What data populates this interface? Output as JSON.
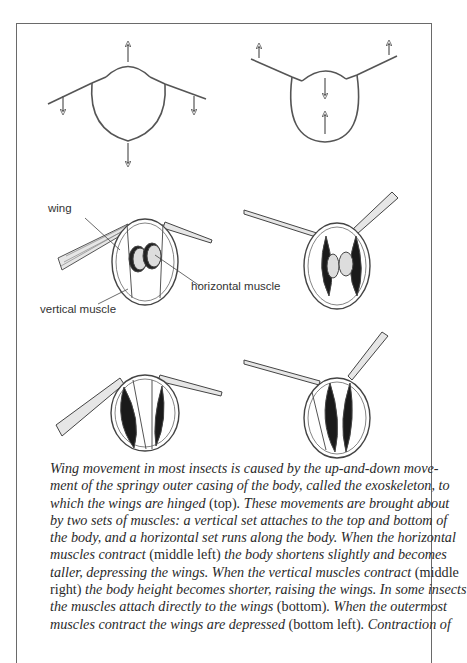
{
  "figure": {
    "labels": {
      "wing": "wing",
      "horizontal_muscle": "horizontal muscle",
      "vertical_muscle": "vertical muscle"
    },
    "panels": [
      {
        "position": "top-left",
        "description": "body cross-section, wings depressed"
      },
      {
        "position": "top-right",
        "description": "body cross-section, wings raised"
      },
      {
        "position": "middle-left",
        "description": "horizontal muscles contract"
      },
      {
        "position": "middle-right",
        "description": "vertical muscles contract"
      },
      {
        "position": "bottom-left",
        "description": "direct muscles, wings depressed"
      },
      {
        "position": "bottom-right",
        "description": "direct muscles, wings raised"
      }
    ]
  },
  "caption": {
    "lines": [
      [
        {
          "t": "Wing movement in most insects is caused by the up-and-down move-",
          "i": true
        }
      ],
      [
        {
          "t": "ment of the springy outer casing of the body, called the exoskeleton, to",
          "i": true
        }
      ],
      [
        {
          "t": "which the wings are hinged ",
          "i": true
        },
        {
          "t": "(top)",
          "i": false
        },
        {
          "t": ". These movements are brought about",
          "i": true
        }
      ],
      [
        {
          "t": "by two sets of muscles: a vertical set attaches to the top and bottom of",
          "i": true
        }
      ],
      [
        {
          "t": "the body, and a horizontal set runs along the body. When the horizontal",
          "i": true
        }
      ],
      [
        {
          "t": "muscles contract ",
          "i": true
        },
        {
          "t": "(middle left)",
          "i": false
        },
        {
          "t": " the body shortens slightly and becomes",
          "i": true
        }
      ],
      [
        {
          "t": "taller, depressing the wings. When the vertical muscles contract ",
          "i": true
        },
        {
          "t": "(middle",
          "i": false
        }
      ],
      [
        {
          "t": "right)",
          "i": false
        },
        {
          "t": " the body height becomes shorter, raising the wings. In some insects",
          "i": true
        }
      ],
      [
        {
          "t": "the muscles attach directly to the wings ",
          "i": true
        },
        {
          "t": "(bottom)",
          "i": false
        },
        {
          "t": ". When the outermost",
          "i": true
        }
      ],
      [
        {
          "t": "muscles contract the wings are depressed ",
          "i": true
        },
        {
          "t": "(bottom left)",
          "i": false
        },
        {
          "t": ". Contraction of",
          "i": true
        }
      ]
    ]
  },
  "colors": {
    "ink": "#2a2a2a",
    "frame": "#6a6a6a",
    "muscle_dark": "#1a1a1a"
  }
}
